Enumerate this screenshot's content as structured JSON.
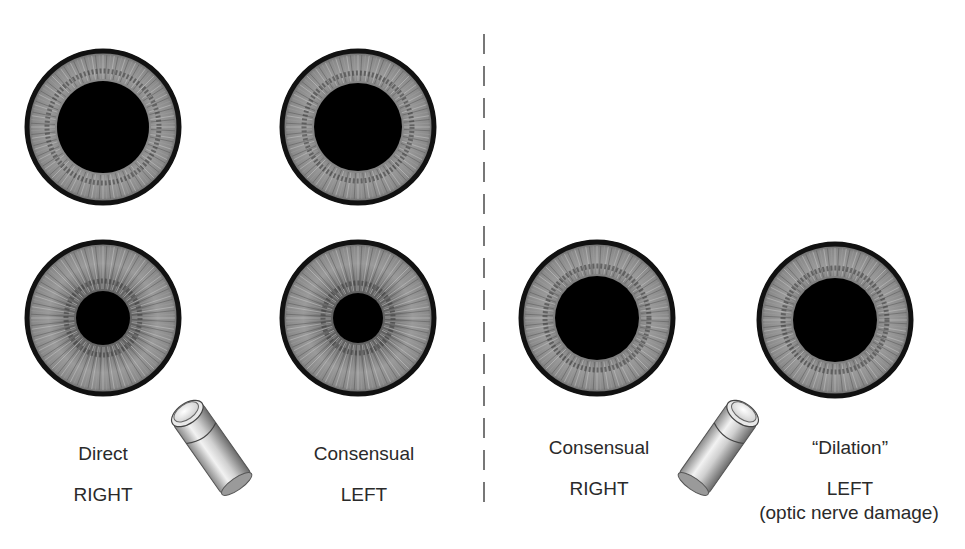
{
  "figure": {
    "left_panel": {
      "top_row": [
        {
          "id": "eye-top-right",
          "cx": 103,
          "cy": 127,
          "r": 78,
          "pupil_r": 46
        },
        {
          "id": "eye-top-left",
          "cx": 358,
          "cy": 127,
          "r": 78,
          "pupil_r": 44
        }
      ],
      "bottom_row": [
        {
          "id": "eye-direct-right",
          "cx": 103,
          "cy": 318,
          "r": 78,
          "pupil_r": 27
        },
        {
          "id": "eye-consensual-left",
          "cx": 358,
          "cy": 318,
          "r": 78,
          "pupil_r": 25
        }
      ],
      "labels": {
        "direct": "Direct",
        "right": "RIGHT",
        "consensual": "Consensual",
        "left": "LEFT"
      }
    },
    "right_panel": {
      "bottom_row": [
        {
          "id": "eye-consensual-right",
          "cx": 597,
          "cy": 318,
          "r": 78,
          "pupil_r": 42
        },
        {
          "id": "eye-dilation-left",
          "cx": 835,
          "cy": 320,
          "r": 78,
          "pupil_r": 42
        }
      ],
      "labels": {
        "consensual": "Consensual",
        "right": "RIGHT",
        "dilation": "“Dilation”",
        "left": "LEFT",
        "note": "(optic nerve damage)"
      }
    },
    "penlights": [
      {
        "id": "penlight-left",
        "x": 155,
        "y": 390,
        "angle": -35
      },
      {
        "id": "penlight-right",
        "x": 675,
        "y": 390,
        "angle": 35
      }
    ],
    "colors": {
      "iris_light": "#a8a8a8",
      "iris_mid": "#7c7c7c",
      "iris_dark": "#4a4a4a",
      "limbus": "#111111",
      "pupil": "#000000",
      "divider": "#777777",
      "text": "#2a2a2a"
    }
  }
}
